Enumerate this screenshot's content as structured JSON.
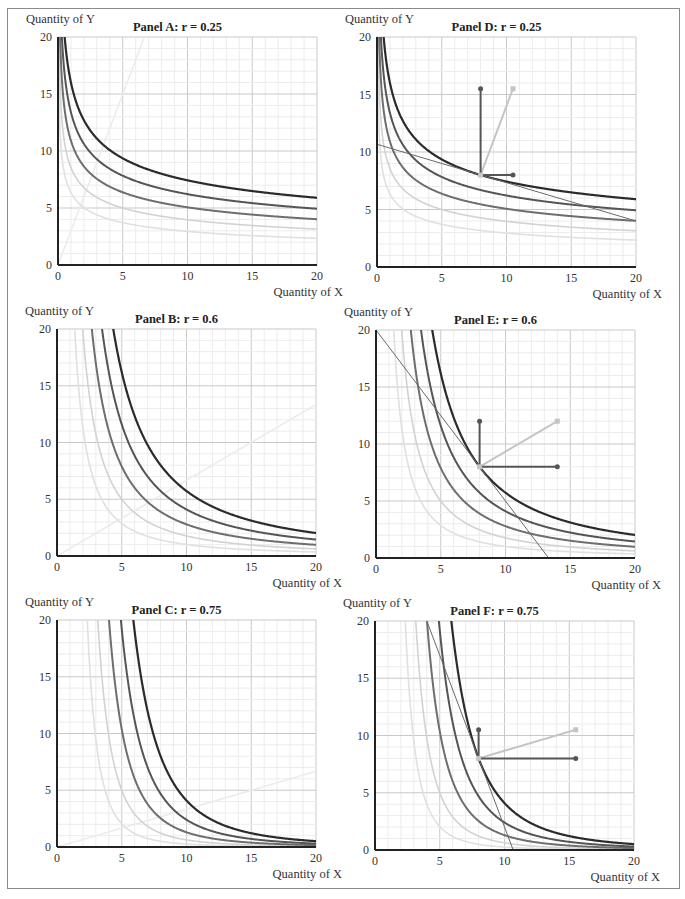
{
  "figure": {
    "y_axis_label": "Quantity of Y",
    "x_axis_label": "Quantity of X",
    "colors": {
      "curve_dark": "#2b2b2b",
      "curve_mid": "#555555",
      "curve_mid2": "#6e6e6e",
      "curve_light1": "#d2d2d2",
      "curve_light2": "#e0e0e0",
      "expansion_path": "#ebebeb",
      "budget_line": "#6a6a6a",
      "arrow_dark": "#555555",
      "arrow_light": "#c4c4c4",
      "grid_minor": "#ececec",
      "grid_major": "#c9c9c9",
      "axis": "#222222"
    }
  },
  "chart_data": [
    {
      "id": "A",
      "type": "line",
      "title": "Panel A: r = 0.25",
      "r": 0.25,
      "xlabel": "Quantity of X",
      "ylabel": "Quantity of Y",
      "xlim": [
        0,
        20
      ],
      "ylim": [
        0,
        20
      ],
      "xticks": [
        0,
        5,
        10,
        15,
        20
      ],
      "yticks": [
        0,
        5,
        10,
        15,
        20
      ],
      "grid": true,
      "indifference_curves": [
        {
          "utility": 8,
          "style": "dark"
        },
        {
          "utility": 7,
          "style": "mid"
        },
        {
          "utility": 6,
          "style": "mid2"
        },
        {
          "utility": 5,
          "style": "light1"
        },
        {
          "utility": 4,
          "style": "light2"
        }
      ],
      "expansion_path": {
        "slope": 3.0
      },
      "budget_line": null,
      "arrows": null
    },
    {
      "id": "B",
      "type": "line",
      "title": "Panel B: r = 0.6",
      "r": 0.6,
      "xlabel": "Quantity of X",
      "ylabel": "Quantity of Y",
      "xlim": [
        0,
        20
      ],
      "ylim": [
        0,
        20
      ],
      "xticks": [
        0,
        5,
        10,
        15,
        20
      ],
      "yticks": [
        0,
        5,
        10,
        15,
        20
      ],
      "grid": true,
      "indifference_curves": [
        {
          "utility": 8,
          "style": "dark"
        },
        {
          "utility": 7,
          "style": "mid"
        },
        {
          "utility": 6,
          "style": "mid2"
        },
        {
          "utility": 5,
          "style": "light1"
        },
        {
          "utility": 4,
          "style": "light2"
        }
      ],
      "expansion_path": {
        "slope": 0.6667
      },
      "budget_line": null,
      "arrows": null
    },
    {
      "id": "C",
      "type": "line",
      "title": "Panel C: r = 0.75",
      "r": 0.75,
      "xlabel": "Quantity of X",
      "ylabel": "Quantity of Y",
      "xlim": [
        0,
        20
      ],
      "ylim": [
        0,
        20
      ],
      "xticks": [
        0,
        5,
        10,
        15,
        20
      ],
      "yticks": [
        0,
        5,
        10,
        15,
        20
      ],
      "grid": true,
      "indifference_curves": [
        {
          "utility": 8,
          "style": "dark"
        },
        {
          "utility": 7,
          "style": "mid"
        },
        {
          "utility": 6,
          "style": "mid2"
        },
        {
          "utility": 5,
          "style": "light1"
        },
        {
          "utility": 4,
          "style": "light2"
        }
      ],
      "expansion_path": {
        "slope": 0.3333
      },
      "budget_line": null,
      "arrows": null
    },
    {
      "id": "D",
      "type": "line",
      "title": "Panel D: r = 0.25",
      "r": 0.25,
      "xlabel": "Quantity of X",
      "ylabel": "Quantity of Y",
      "xlim": [
        0,
        20
      ],
      "ylim": [
        0,
        20
      ],
      "xticks": [
        0,
        5,
        10,
        15,
        20
      ],
      "yticks": [
        0,
        5,
        10,
        15,
        20
      ],
      "grid": true,
      "indifference_curves": [
        {
          "utility": 8,
          "style": "dark"
        },
        {
          "utility": 7,
          "style": "mid"
        },
        {
          "utility": 6,
          "style": "mid2"
        },
        {
          "utility": 5,
          "style": "light1"
        },
        {
          "utility": 4,
          "style": "light2"
        }
      ],
      "expansion_path": null,
      "budget_line": {
        "from": [
          0,
          10.67
        ],
        "to": [
          20,
          4.0
        ]
      },
      "arrows": {
        "origin": [
          8,
          8
        ],
        "vertical_end": [
          8,
          15.5
        ],
        "horizontal_end": [
          10.5,
          8
        ],
        "resultant_end": [
          10.5,
          15.5
        ]
      }
    },
    {
      "id": "E",
      "type": "line",
      "title": "Panel E: r = 0.6",
      "r": 0.6,
      "xlabel": "Quantity of X",
      "ylabel": "Quantity of Y",
      "xlim": [
        0,
        20
      ],
      "ylim": [
        0,
        20
      ],
      "xticks": [
        0,
        5,
        10,
        15,
        20
      ],
      "yticks": [
        0,
        5,
        10,
        15,
        20
      ],
      "grid": true,
      "indifference_curves": [
        {
          "utility": 8,
          "style": "dark"
        },
        {
          "utility": 7,
          "style": "mid"
        },
        {
          "utility": 6,
          "style": "mid2"
        },
        {
          "utility": 5,
          "style": "light1"
        },
        {
          "utility": 4,
          "style": "light2"
        }
      ],
      "expansion_path": null,
      "budget_line": {
        "from": [
          0,
          20
        ],
        "to": [
          13.33,
          0
        ]
      },
      "arrows": {
        "origin": [
          8,
          8
        ],
        "vertical_end": [
          8,
          12
        ],
        "horizontal_end": [
          14,
          8
        ],
        "resultant_end": [
          14,
          12
        ]
      }
    },
    {
      "id": "F",
      "type": "line",
      "title": "Panel F: r = 0.75",
      "r": 0.75,
      "xlabel": "Quantity of X",
      "ylabel": "Quantity of Y",
      "xlim": [
        0,
        20
      ],
      "ylim": [
        0,
        20
      ],
      "xticks": [
        0,
        5,
        10,
        15,
        20
      ],
      "yticks": [
        0,
        5,
        10,
        15,
        20
      ],
      "grid": true,
      "indifference_curves": [
        {
          "utility": 8,
          "style": "dark"
        },
        {
          "utility": 7,
          "style": "mid"
        },
        {
          "utility": 6,
          "style": "mid2"
        },
        {
          "utility": 5,
          "style": "light1"
        },
        {
          "utility": 4,
          "style": "light2"
        }
      ],
      "expansion_path": null,
      "budget_line": {
        "from": [
          4,
          20
        ],
        "to": [
          10.67,
          0
        ]
      },
      "arrows": {
        "origin": [
          8,
          8
        ],
        "vertical_end": [
          8,
          10.5
        ],
        "horizontal_end": [
          15.5,
          8
        ],
        "resultant_end": [
          15.5,
          10.5
        ]
      }
    }
  ],
  "layout": {
    "panels": [
      {
        "id": "A",
        "plot": {
          "left": 58,
          "top": 37,
          "right": 317,
          "bottom": 265
        }
      },
      {
        "id": "B",
        "plot": {
          "left": 57,
          "top": 329,
          "right": 316,
          "bottom": 556
        }
      },
      {
        "id": "C",
        "plot": {
          "left": 57,
          "top": 620,
          "right": 316,
          "bottom": 847
        }
      },
      {
        "id": "D",
        "plot": {
          "left": 377,
          "top": 37,
          "right": 636,
          "bottom": 267
        }
      },
      {
        "id": "E",
        "plot": {
          "left": 376,
          "top": 330,
          "right": 635,
          "bottom": 558
        }
      },
      {
        "id": "F",
        "plot": {
          "left": 375,
          "top": 621,
          "right": 634,
          "bottom": 850
        }
      }
    ]
  }
}
